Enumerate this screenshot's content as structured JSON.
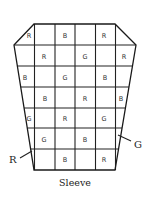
{
  "diagram": {
    "caption": "Sleeve",
    "legend_callouts": [
      {
        "label": "R",
        "x": 13,
        "y": 163
      },
      {
        "label": "G",
        "x": 137,
        "y": 148
      }
    ],
    "outline": {
      "points": [
        [
          34,
          24
        ],
        [
          115,
          24
        ],
        [
          136,
          45
        ],
        [
          115,
          170
        ],
        [
          34,
          170
        ],
        [
          14,
          45
        ]
      ]
    },
    "vertical_lines_x": [
      34.5,
      55,
      75,
      95.5,
      115.5
    ],
    "horizontal_lines_y": [
      45,
      66,
      87,
      108,
      128,
      149
    ],
    "cells": [
      {
        "row": 0,
        "letter": "R",
        "x": 29,
        "y": 38
      },
      {
        "row": 0,
        "letter": "B",
        "x": 65,
        "y": 38
      },
      {
        "row": 0,
        "letter": "R",
        "x": 104,
        "y": 38
      },
      {
        "row": 1,
        "letter": "R",
        "x": 44,
        "y": 59
      },
      {
        "row": 1,
        "letter": "G",
        "x": 85,
        "y": 59
      },
      {
        "row": 1,
        "letter": "R",
        "x": 124,
        "y": 59
      },
      {
        "row": 2,
        "letter": "B",
        "x": 25,
        "y": 80
      },
      {
        "row": 2,
        "letter": "G",
        "x": 65,
        "y": 80
      },
      {
        "row": 2,
        "letter": "B",
        "x": 105,
        "y": 80
      },
      {
        "row": 3,
        "letter": "B",
        "x": 45,
        "y": 101
      },
      {
        "row": 3,
        "letter": "R",
        "x": 85,
        "y": 101
      },
      {
        "row": 3,
        "letter": "B",
        "x": 121,
        "y": 101
      },
      {
        "row": 4,
        "letter": "G",
        "x": 29,
        "y": 121
      },
      {
        "row": 4,
        "letter": "R",
        "x": 65,
        "y": 121
      },
      {
        "row": 4,
        "letter": "G",
        "x": 104,
        "y": 121
      },
      {
        "row": 5,
        "letter": "G",
        "x": 44,
        "y": 142
      },
      {
        "row": 5,
        "letter": "B",
        "x": 85,
        "y": 142
      },
      {
        "row": 6,
        "letter": "B",
        "x": 65,
        "y": 162
      },
      {
        "row": 6,
        "letter": "R",
        "x": 104,
        "y": 162
      }
    ]
  }
}
